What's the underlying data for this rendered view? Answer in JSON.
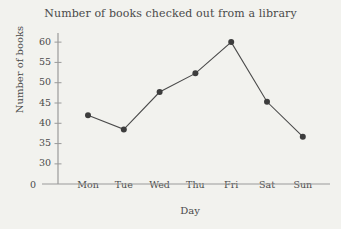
{
  "chart_data": {
    "type": "line",
    "title": "Number of books checked out from a library",
    "xlabel": "Day",
    "ylabel": "Number of books",
    "categories": [
      "Mon",
      "Tue",
      "Wed",
      "Thu",
      "Fri",
      "Sat",
      "Sun"
    ],
    "values": [
      42,
      38.5,
      47.7,
      52.3,
      60,
      45.3,
      36.7
    ],
    "series": [
      {
        "name": "Number of books",
        "values": [
          42,
          38.5,
          47.7,
          52.3,
          60,
          45.3,
          36.7
        ]
      }
    ],
    "ylim": [
      28,
      62
    ],
    "yticks": [
      30,
      35,
      40,
      45,
      50,
      55,
      60
    ],
    "ytick_labels": [
      "30",
      "35",
      "40",
      "45",
      "50",
      "55",
      "60"
    ],
    "origin_label": "0",
    "grid": false,
    "legend": null,
    "marker": "circle",
    "line_color": "#4a4a4a",
    "marker_color": "#3d3d3d",
    "axis_color": "#9a9a9a",
    "text_color": "#4a4a4a",
    "background_color": "#f2f2ee"
  }
}
